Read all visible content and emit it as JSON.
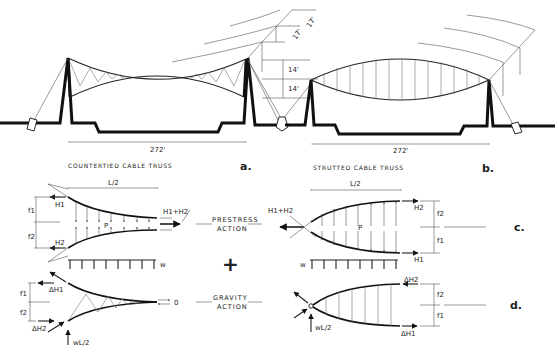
{
  "figure_a": {
    "caption": "COUNTERTIED CABLE TRUSS",
    "letter": "a.",
    "span": "272'"
  },
  "figure_b": {
    "caption": "STRUTTED CABLE TRUSS",
    "letter": "b.",
    "span": "272'"
  },
  "center_dims": {
    "d1": "17'",
    "d2": "17'",
    "d3": "14'",
    "d4": "14'"
  },
  "figure_c": {
    "letter": "c.",
    "left": {
      "half_span": "L/2",
      "f1": "f1",
      "f2": "f2",
      "H1": "H1",
      "H2": "H2",
      "resultant": "H1+H2",
      "p": "P",
      "w": "w"
    },
    "right": {
      "half_span": "L/2",
      "f1": "f1",
      "f2": "f2",
      "H1": "H1",
      "H2": "H2",
      "resultant": "H1+H2",
      "p": "P",
      "w": "w"
    },
    "action_label_1": "PRESTRESS",
    "action_label_2": "ACTION"
  },
  "plus_sign": "+",
  "figure_d": {
    "letter": "d.",
    "left": {
      "f1": "f1",
      "f2": "f2",
      "dH1": "ΔH1",
      "dH2": "ΔH2",
      "reaction": "wL/2",
      "zero": "0"
    },
    "right": {
      "f1": "f1",
      "f2": "f2",
      "dH1": "ΔH1",
      "dH2": "ΔH2",
      "reaction": "wL/2"
    },
    "action_label_1": "GRAVITY",
    "action_label_2": "ACTION"
  }
}
